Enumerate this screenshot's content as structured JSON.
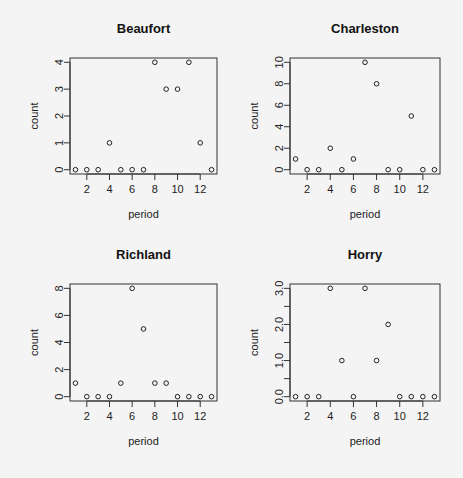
{
  "chart_data": [
    {
      "type": "scatter",
      "title": "Beaufort",
      "xlabel": "period",
      "ylabel": "count",
      "x": [
        1,
        2,
        3,
        4,
        5,
        6,
        7,
        8,
        9,
        10,
        11,
        12,
        13
      ],
      "values": [
        0,
        0,
        0,
        1,
        0,
        0,
        0,
        4,
        3,
        3,
        4,
        1,
        0
      ],
      "xticks": [
        2,
        4,
        6,
        8,
        10,
        12
      ],
      "yticks": [
        0,
        1,
        2,
        3,
        4
      ],
      "ytick_labels": [
        "0",
        "1",
        "2",
        "3",
        "4"
      ],
      "xlim": [
        1,
        13
      ],
      "ylim": [
        0,
        4
      ]
    },
    {
      "type": "scatter",
      "title": "Charleston",
      "xlabel": "period",
      "ylabel": "count",
      "x": [
        1,
        2,
        3,
        4,
        5,
        6,
        7,
        8,
        9,
        10,
        11,
        12,
        13
      ],
      "values": [
        1,
        0,
        0,
        2,
        0,
        1,
        10,
        8,
        0,
        0,
        5,
        0,
        0
      ],
      "xticks": [
        2,
        4,
        6,
        8,
        10,
        12
      ],
      "yticks": [
        0,
        2,
        4,
        6,
        8,
        10
      ],
      "ytick_labels": [
        "0",
        "2",
        "4",
        "6",
        "8",
        "10"
      ],
      "xlim": [
        1,
        13
      ],
      "ylim": [
        0,
        10
      ]
    },
    {
      "type": "scatter",
      "title": "Richland",
      "xlabel": "period",
      "ylabel": "count",
      "x": [
        1,
        2,
        3,
        4,
        5,
        6,
        7,
        8,
        9,
        10,
        11,
        12,
        13
      ],
      "values": [
        1,
        0,
        0,
        0,
        1,
        8,
        5,
        1,
        1,
        0,
        0,
        0,
        0
      ],
      "xticks": [
        2,
        4,
        6,
        8,
        10,
        12
      ],
      "yticks": [
        0,
        2,
        4,
        6,
        8
      ],
      "ytick_labels": [
        "0",
        "2",
        "4",
        "6",
        "8"
      ],
      "xlim": [
        1,
        13
      ],
      "ylim": [
        0,
        8
      ]
    },
    {
      "type": "scatter",
      "title": "Horry",
      "xlabel": "period",
      "ylabel": "count",
      "x": [
        1,
        2,
        3,
        4,
        5,
        6,
        7,
        8,
        9,
        10,
        11,
        12,
        13
      ],
      "values": [
        0,
        0,
        0,
        3,
        1,
        0,
        3,
        1,
        2,
        0,
        0,
        0,
        0
      ],
      "xticks": [
        2,
        4,
        6,
        8,
        10,
        12
      ],
      "yticks": [
        0,
        0.5,
        1,
        1.5,
        2,
        2.5,
        3
      ],
      "ytick_labels": [
        "0.0",
        "",
        "1.0",
        "",
        "2.0",
        "",
        "3.0"
      ],
      "xlim": [
        1,
        13
      ],
      "ylim": [
        0,
        3
      ]
    }
  ]
}
